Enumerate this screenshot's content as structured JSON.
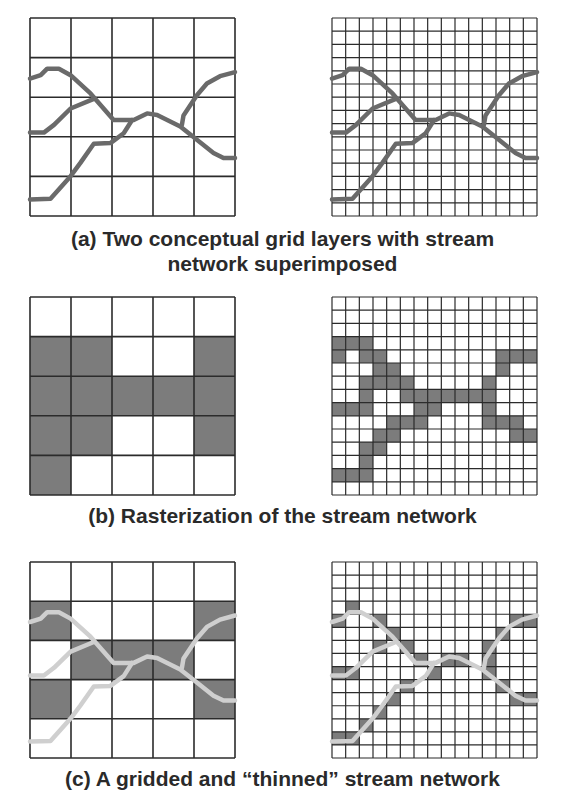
{
  "colors": {
    "grid_line": "#2b2b2b",
    "stream_dark": "#6a6a6a",
    "stream_light": "#cfcfcf",
    "cell_fill": "#7c7c7c",
    "background": "#ffffff",
    "caption": "#2a2a2a"
  },
  "captions": {
    "a_line1": "(a) Two conceptual grid layers with stream",
    "a_line2": "network superimposed",
    "b": "(b) Rasterization of the stream network",
    "c": "(c) A gridded and “thinned” stream network"
  },
  "streams": [
    [
      [
        0,
        0.306
      ],
      [
        0.052,
        0.289
      ],
      [
        0.084,
        0.256
      ],
      [
        0.141,
        0.256
      ],
      [
        0.198,
        0.289
      ],
      [
        0.295,
        0.381
      ],
      [
        0.408,
        0.515
      ],
      [
        0.506,
        0.515
      ],
      [
        0.571,
        0.482
      ],
      [
        0.62,
        0.49
      ],
      [
        0.733,
        0.548
      ],
      [
        0.814,
        0.615
      ],
      [
        0.895,
        0.682
      ],
      [
        0.944,
        0.707
      ],
      [
        1,
        0.707
      ]
    ],
    [
      [
        0,
        0.579
      ],
      [
        0.068,
        0.579
      ],
      [
        0.117,
        0.54
      ],
      [
        0.198,
        0.457
      ],
      [
        0.311,
        0.408
      ]
    ],
    [
      [
        0,
        0.916
      ],
      [
        0.1,
        0.913
      ],
      [
        0.198,
        0.799
      ],
      [
        0.246,
        0.732
      ],
      [
        0.311,
        0.635
      ],
      [
        0.392,
        0.632
      ],
      [
        0.457,
        0.582
      ],
      [
        0.498,
        0.515
      ]
    ],
    [
      [
        0.741,
        0.54
      ],
      [
        0.749,
        0.492
      ],
      [
        0.814,
        0.39
      ],
      [
        0.863,
        0.331
      ],
      [
        0.927,
        0.294
      ],
      [
        1,
        0.273
      ]
    ]
  ],
  "panels": [
    {
      "id": "a-coarse",
      "x": 30,
      "y": 18,
      "w": 205,
      "h": 198,
      "n": 5,
      "stream_style": "dark",
      "cells": []
    },
    {
      "id": "a-fine",
      "x": 332,
      "y": 18,
      "w": 205,
      "h": 198,
      "n": 15,
      "stream_style": "dark",
      "cells": []
    },
    {
      "id": "b-coarse",
      "x": 30,
      "y": 297,
      "w": 205,
      "h": 198,
      "n": 5,
      "stream_style": "none",
      "cells": [
        [
          1,
          0
        ],
        [
          1,
          1
        ],
        [
          1,
          4
        ],
        [
          2,
          0
        ],
        [
          2,
          1
        ],
        [
          2,
          2
        ],
        [
          2,
          3
        ],
        [
          2,
          4
        ],
        [
          3,
          0
        ],
        [
          3,
          1
        ],
        [
          3,
          4
        ],
        [
          4,
          0
        ]
      ]
    },
    {
      "id": "b-fine",
      "x": 332,
      "y": 297,
      "w": 205,
      "h": 198,
      "n": 15,
      "stream_style": "none",
      "cells": [
        [
          3,
          0
        ],
        [
          3,
          1
        ],
        [
          3,
          2
        ],
        [
          4,
          0
        ],
        [
          4,
          2
        ],
        [
          4,
          3
        ],
        [
          4,
          12
        ],
        [
          4,
          13
        ],
        [
          4,
          14
        ],
        [
          5,
          3
        ],
        [
          5,
          4
        ],
        [
          5,
          12
        ],
        [
          6,
          2
        ],
        [
          6,
          3
        ],
        [
          6,
          4
        ],
        [
          6,
          5
        ],
        [
          6,
          11
        ],
        [
          7,
          2
        ],
        [
          7,
          5
        ],
        [
          7,
          6
        ],
        [
          7,
          7
        ],
        [
          7,
          8
        ],
        [
          7,
          9
        ],
        [
          7,
          10
        ],
        [
          7,
          11
        ],
        [
          8,
          0
        ],
        [
          8,
          1
        ],
        [
          8,
          2
        ],
        [
          8,
          6
        ],
        [
          8,
          7
        ],
        [
          8,
          11
        ],
        [
          9,
          4
        ],
        [
          9,
          5
        ],
        [
          9,
          6
        ],
        [
          9,
          11
        ],
        [
          9,
          12
        ],
        [
          9,
          13
        ],
        [
          10,
          3
        ],
        [
          10,
          4
        ],
        [
          10,
          13
        ],
        [
          10,
          14
        ],
        [
          11,
          2
        ],
        [
          11,
          3
        ],
        [
          12,
          2
        ],
        [
          13,
          0
        ],
        [
          13,
          1
        ],
        [
          13,
          2
        ]
      ]
    },
    {
      "id": "c-coarse",
      "x": 30,
      "y": 562,
      "w": 205,
      "h": 196,
      "n": 5,
      "stream_style": "light",
      "cells": [
        [
          1,
          0
        ],
        [
          1,
          4
        ],
        [
          2,
          1
        ],
        [
          2,
          2
        ],
        [
          2,
          3
        ],
        [
          3,
          0
        ],
        [
          3,
          4
        ]
      ]
    },
    {
      "id": "c-fine",
      "x": 332,
      "y": 562,
      "w": 205,
      "h": 196,
      "n": 15,
      "stream_style": "light",
      "cells": [
        [
          3,
          1
        ],
        [
          4,
          0
        ],
        [
          4,
          3
        ],
        [
          4,
          13
        ],
        [
          4,
          14
        ],
        [
          5,
          4
        ],
        [
          5,
          12
        ],
        [
          6,
          3
        ],
        [
          6,
          5
        ],
        [
          6,
          11
        ],
        [
          7,
          6
        ],
        [
          7,
          8
        ],
        [
          7,
          9
        ],
        [
          7,
          11
        ],
        [
          8,
          0
        ],
        [
          8,
          1
        ],
        [
          8,
          7
        ],
        [
          8,
          11
        ],
        [
          9,
          5
        ],
        [
          9,
          12
        ],
        [
          10,
          4
        ],
        [
          10,
          13
        ],
        [
          10,
          14
        ],
        [
          11,
          3
        ],
        [
          12,
          2
        ],
        [
          13,
          0
        ],
        [
          13,
          1
        ]
      ]
    }
  ]
}
